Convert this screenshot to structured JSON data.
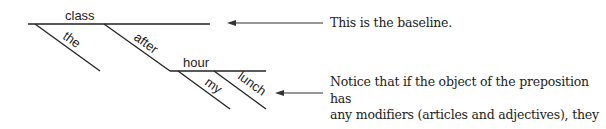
{
  "diagram": {
    "words": {
      "subject": "class",
      "article": "the",
      "preposition": "after",
      "object": "hour",
      "modifier1": "my",
      "modifier2": "lunch"
    },
    "annotations": {
      "baseline_note": "This is the baseline.",
      "modifier_note_line1": "Notice that if the object of the preposition has",
      "modifier_note_line2": "any modifiers (articles and adjectives), they go",
      "modifier_note_line3": "on diagonal lines attached to the object."
    },
    "colors": {
      "line": "#222222",
      "text": "#222222"
    }
  }
}
